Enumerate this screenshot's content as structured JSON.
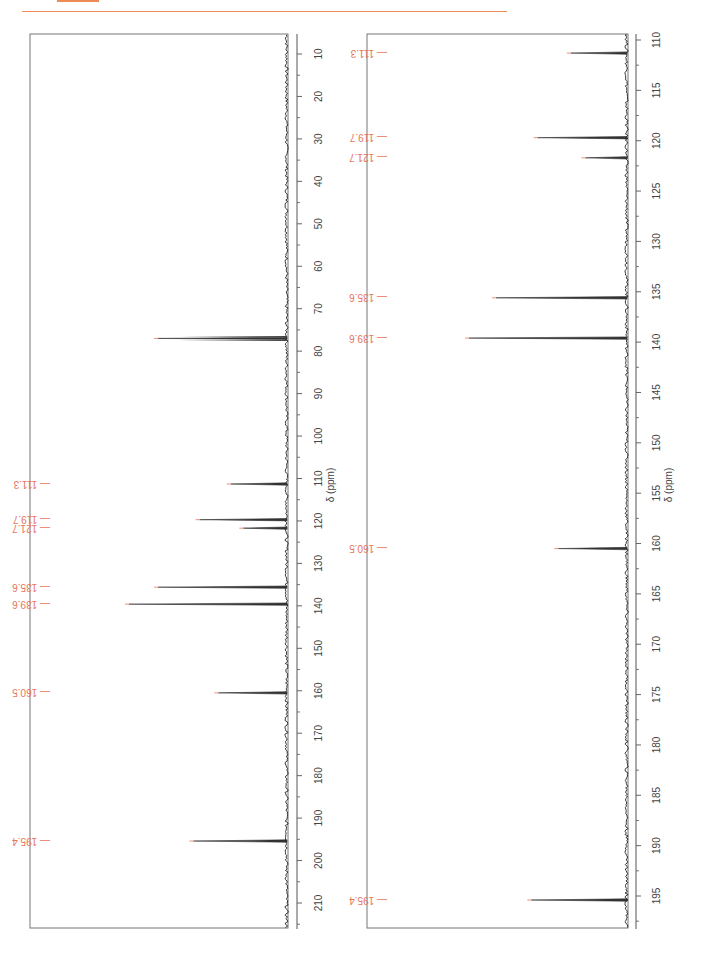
{
  "page": {
    "accent_color": "#ee8a55",
    "label_color": "#e8735a"
  },
  "chart_data": [
    {
      "type": "line",
      "title": "13C NMR spectrum (full range)",
      "xlabel": "δ (ppm)",
      "ylabel": "",
      "orientation": "rotated-90",
      "axis_range": [
        5,
        215
      ],
      "ticks": [
        10,
        20,
        30,
        40,
        50,
        60,
        70,
        80,
        90,
        100,
        110,
        120,
        130,
        140,
        150,
        160,
        170,
        180,
        190,
        200,
        210
      ],
      "grid": false,
      "legend": null,
      "peaks": [
        {
          "ppm": 77.0,
          "intensity": 0.62,
          "label": ""
        },
        {
          "ppm": 111.3,
          "intensity": 0.27,
          "label": "111.3"
        },
        {
          "ppm": 119.7,
          "intensity": 0.42,
          "label": "119.7"
        },
        {
          "ppm": 121.7,
          "intensity": 0.21,
          "label": "121.7"
        },
        {
          "ppm": 135.6,
          "intensity": 0.62,
          "label": "135.6"
        },
        {
          "ppm": 139.6,
          "intensity": 0.76,
          "label": "139.6"
        },
        {
          "ppm": 160.5,
          "intensity": 0.33,
          "label": "160.5"
        },
        {
          "ppm": 195.4,
          "intensity": 0.45,
          "label": "195.4"
        }
      ]
    },
    {
      "type": "line",
      "title": "13C NMR spectrum (expanded 110–197 ppm)",
      "xlabel": "δ (ppm)",
      "ylabel": "",
      "orientation": "rotated-90",
      "axis_range": [
        109.4,
        197.5
      ],
      "ticks": [
        110,
        115,
        120,
        125,
        130,
        135,
        140,
        145,
        150,
        155,
        160,
        165,
        170,
        175,
        180,
        185,
        190,
        195
      ],
      "grid": false,
      "legend": null,
      "peaks": [
        {
          "ppm": 111.3,
          "intensity": 0.27,
          "label": "111.3"
        },
        {
          "ppm": 119.7,
          "intensity": 0.43,
          "label": "119.7"
        },
        {
          "ppm": 121.7,
          "intensity": 0.2,
          "label": "121.7"
        },
        {
          "ppm": 135.6,
          "intensity": 0.63,
          "label": "135.6"
        },
        {
          "ppm": 139.6,
          "intensity": 0.76,
          "label": "139.6"
        },
        {
          "ppm": 160.5,
          "intensity": 0.33,
          "label": "160.5"
        },
        {
          "ppm": 195.4,
          "intensity": 0.46,
          "label": "195.4"
        }
      ]
    }
  ]
}
